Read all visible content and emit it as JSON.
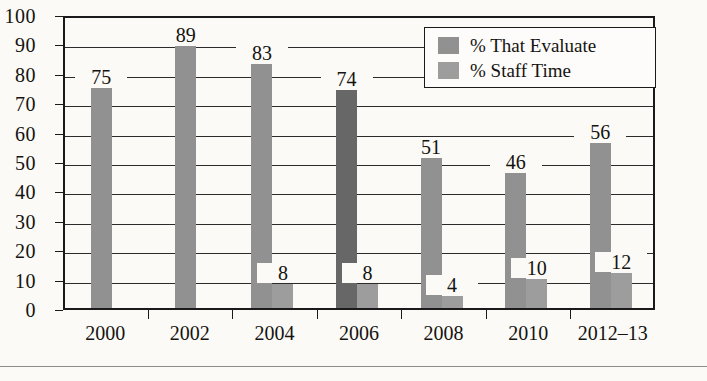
{
  "chart_data": {
    "type": "bar",
    "title": "",
    "subtitle": "",
    "xlabel": "",
    "ylabel": "",
    "ylim": [
      0,
      100
    ],
    "ytick_step": 10,
    "yticks": [
      0,
      10,
      20,
      30,
      40,
      50,
      60,
      70,
      80,
      90,
      100
    ],
    "grid": true,
    "legend_position": "top-right",
    "categories": [
      "2000",
      "2002",
      "2004",
      "2006",
      "2008",
      "2010",
      "2012–13"
    ],
    "series": [
      {
        "name": "% That Evaluate",
        "color": "#919191",
        "values": [
          75,
          89,
          83,
          74,
          51,
          46,
          56
        ],
        "labels": [
          "75",
          "89",
          "83",
          "74",
          "51",
          "46",
          "56"
        ]
      },
      {
        "name": "% Staff Time",
        "color": "#9d9d9d",
        "values": [
          null,
          null,
          8,
          8,
          4,
          10,
          12
        ],
        "labels": [
          "",
          "",
          "8",
          "8",
          "4",
          "10",
          "12"
        ]
      }
    ],
    "highlight": {
      "category": "2006",
      "series": "% That Evaluate",
      "color": "#676767"
    }
  },
  "legend": {
    "items": [
      {
        "label": "% That Evaluate",
        "color": "#919191"
      },
      {
        "label": "% Staff Time",
        "color": "#9d9d9d"
      }
    ]
  },
  "colors": {
    "background": "#fbfaf7",
    "axis": "#1a1a1a",
    "grid": "#2b2b2b",
    "text": "#15130f",
    "series_1": "#919191",
    "series_2": "#9d9d9d",
    "highlight_bar": "#676767",
    "footer_rule": "#8d8d8d"
  }
}
